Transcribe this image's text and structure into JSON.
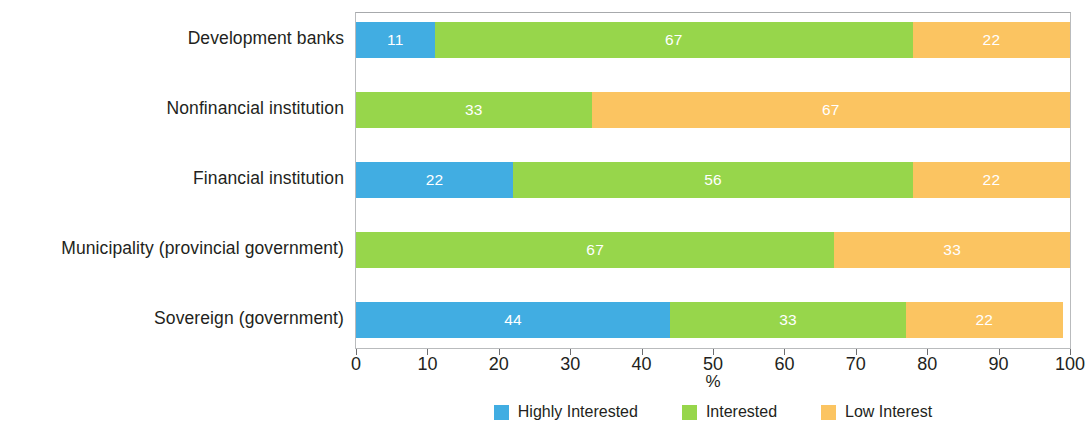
{
  "chart_data": {
    "type": "bar",
    "orientation": "horizontal",
    "stacked": true,
    "stack_mode": "percent",
    "title": "",
    "xlabel": "%",
    "ylabel": "",
    "xlim": [
      0,
      100
    ],
    "xticks": [
      0,
      10,
      20,
      30,
      40,
      50,
      60,
      70,
      80,
      90,
      100
    ],
    "xtick_labels": [
      "0",
      "10",
      "20",
      "30",
      "40",
      "50",
      "60",
      "70",
      "80",
      "90",
      "100"
    ],
    "grid": false,
    "legend_position": "bottom",
    "categories": [
      "Development banks",
      "Nonfinancial institution",
      "Financial institution",
      "Municipality (provincial government)",
      "Sovereign (government)"
    ],
    "series": [
      {
        "name": "Highly Interested",
        "color": "#41ADE2",
        "values": [
          11,
          null,
          22,
          null,
          44
        ],
        "labels": [
          "11",
          "",
          "22",
          "",
          "44"
        ]
      },
      {
        "name": "Interested",
        "color": "#97D64B",
        "values": [
          67,
          33,
          56,
          67,
          33
        ],
        "labels": [
          "67",
          "33",
          "56",
          "67",
          "33"
        ]
      },
      {
        "name": "Low Interest",
        "color": "#FBC461",
        "values": [
          22,
          67,
          22,
          33,
          22
        ],
        "labels": [
          "22",
          "67",
          "22",
          "33",
          "22"
        ]
      }
    ],
    "rows": [
      {
        "category": "Development banks",
        "segments": [
          {
            "series": "Highly Interested",
            "value": 11,
            "label": "11",
            "color": "#41ADE2"
          },
          {
            "series": "Interested",
            "value": 67,
            "label": "67",
            "color": "#97D64B"
          },
          {
            "series": "Low Interest",
            "value": 22,
            "label": "22",
            "color": "#FBC461"
          }
        ]
      },
      {
        "category": "Nonfinancial institution",
        "segments": [
          {
            "series": "Interested",
            "value": 33,
            "label": "33",
            "color": "#97D64B"
          },
          {
            "series": "Low Interest",
            "value": 67,
            "label": "67",
            "color": "#FBC461"
          }
        ]
      },
      {
        "category": "Financial institution",
        "segments": [
          {
            "series": "Highly Interested",
            "value": 22,
            "label": "22",
            "color": "#41ADE2"
          },
          {
            "series": "Interested",
            "value": 56,
            "label": "56",
            "color": "#97D64B"
          },
          {
            "series": "Low Interest",
            "value": 22,
            "label": "22",
            "color": "#FBC461"
          }
        ]
      },
      {
        "category": "Municipality (provincial government)",
        "segments": [
          {
            "series": "Interested",
            "value": 67,
            "label": "67",
            "color": "#97D64B"
          },
          {
            "series": "Low Interest",
            "value": 33,
            "label": "33",
            "color": "#FBC461"
          }
        ]
      },
      {
        "category": "Sovereign (government)",
        "segments": [
          {
            "series": "Highly Interested",
            "value": 44,
            "label": "44",
            "color": "#41ADE2"
          },
          {
            "series": "Interested",
            "value": 33,
            "label": "33",
            "color": "#97D64B"
          },
          {
            "series": "Low Interest",
            "value": 22,
            "label": "22",
            "color": "#FBC461"
          }
        ]
      }
    ],
    "legend": [
      {
        "label": "Highly Interested",
        "color": "#41ADE2"
      },
      {
        "label": "Interested",
        "color": "#97D64B"
      },
      {
        "label": "Low Interest",
        "color": "#FBC461"
      }
    ]
  }
}
